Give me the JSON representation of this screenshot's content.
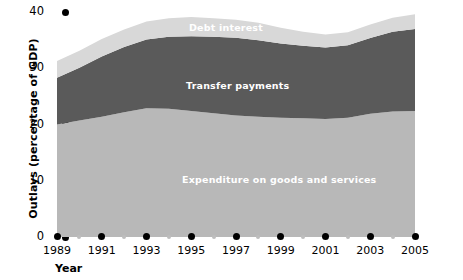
{
  "chart_data": {
    "type": "area",
    "stacked": true,
    "title": "",
    "xlabel": "Year",
    "ylabel": "Outlays (percentage of GDP)",
    "ylim": [
      0,
      40
    ],
    "xlim": [
      1989,
      2005
    ],
    "grid": false,
    "legend_position": "inline-labels",
    "y_ticks": [
      0,
      10,
      20,
      30,
      40
    ],
    "y_tick_labels": [
      "0",
      "10",
      "20",
      "30",
      "40"
    ],
    "x_ticks": [
      1989,
      1991,
      1993,
      1995,
      1997,
      1999,
      2001,
      2003,
      2005
    ],
    "x_tick_labels": [
      "1989",
      "1991",
      "1993",
      "1995",
      "1997",
      "1999",
      "2001",
      "2003",
      "2005"
    ],
    "x_minor_ticks": [
      1990,
      1992,
      1994,
      1996,
      1998,
      2000,
      2002,
      2004
    ],
    "x": [
      1989,
      1990,
      1991,
      1992,
      1993,
      1994,
      1995,
      1996,
      1997,
      1998,
      1999,
      2000,
      2001,
      2002,
      2003,
      2004,
      2005
    ],
    "series": [
      {
        "name": "Expenditure on goods and services",
        "color": "#b8b8b8",
        "values": [
          20.0,
          20.7,
          21.4,
          22.2,
          22.9,
          22.8,
          22.4,
          22.0,
          21.6,
          21.4,
          21.2,
          21.1,
          21.0,
          21.2,
          21.9,
          22.3,
          22.4
        ]
      },
      {
        "name": "Transfer payments",
        "color": "#5a5a5a",
        "values": [
          8.3,
          9.4,
          10.7,
          11.6,
          12.2,
          12.8,
          13.3,
          13.6,
          13.8,
          13.6,
          13.2,
          12.9,
          12.7,
          12.9,
          13.5,
          14.2,
          14.6
        ]
      },
      {
        "name": "Debt interest",
        "color": "#d8d8d8",
        "values": [
          3.0,
          3.0,
          3.1,
          3.1,
          3.2,
          3.3,
          3.4,
          3.3,
          3.2,
          3.1,
          2.8,
          2.5,
          2.3,
          2.3,
          2.4,
          2.5,
          2.6
        ]
      }
    ],
    "totals": [
      31.3,
      33.1,
      35.2,
      36.9,
      38.3,
      38.9,
      39.1,
      38.9,
      38.6,
      38.1,
      37.2,
      36.5,
      36.0,
      36.4,
      37.8,
      39.0,
      39.6
    ],
    "colors": {
      "expenditure": "#b8b8b8",
      "transfer_payments": "#5a5a5a",
      "debt_interest": "#d8d8d8",
      "axis": "#000000",
      "minor_tick": "#bdbdbd",
      "label_text": "#ffffff",
      "background": "#ffffff"
    }
  },
  "axes": {
    "y_title": "Outlays (percentage of GDP)",
    "x_title": "Year"
  },
  "series_labels": {
    "debt_interest": "Debt interest",
    "transfer_payments": "Transfer payments",
    "expenditure": "Expenditure on goods and services"
  }
}
